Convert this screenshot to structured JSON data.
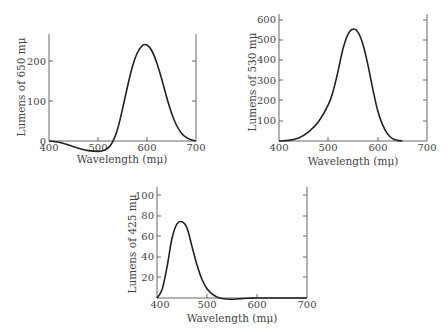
{
  "chart_data": [
    {
      "type": "line",
      "title": "",
      "xlabel": "Wavelength (mμ)",
      "ylabel": "Lumens of 650 mμ",
      "xlim": [
        400,
        700
      ],
      "ylim": [
        -30,
        260
      ],
      "xticks": [
        400,
        500,
        600,
        700
      ],
      "yticks": [
        0,
        100,
        200
      ],
      "grid": false,
      "x": [
        400,
        420,
        440,
        460,
        480,
        500,
        510,
        520,
        530,
        540,
        550,
        560,
        570,
        580,
        590,
        600,
        610,
        620,
        630,
        640,
        650,
        660,
        670,
        680,
        690,
        700
      ],
      "values": [
        0,
        -3,
        -10,
        -18,
        -24,
        -26,
        -24,
        -18,
        -2,
        30,
        80,
        135,
        185,
        220,
        238,
        240,
        225,
        195,
        155,
        110,
        70,
        40,
        20,
        9,
        3,
        0
      ],
      "plot_box": {
        "x0": 49,
        "x1": 196,
        "y_zero": 141,
        "px_per_unit_y": 0.4
      }
    },
    {
      "type": "line",
      "title": "",
      "xlabel": "Wavelength (mμ)",
      "ylabel": "Lumens of 530 mμ",
      "xlim": [
        400,
        700
      ],
      "ylim": [
        0,
        640
      ],
      "xticks": [
        400,
        500,
        600,
        700
      ],
      "yticks": [
        100,
        200,
        300,
        400,
        500,
        600
      ],
      "grid": false,
      "x": [
        400,
        420,
        440,
        460,
        480,
        500,
        510,
        520,
        530,
        540,
        550,
        560,
        570,
        580,
        590,
        600,
        610,
        620,
        630,
        640,
        650
      ],
      "values": [
        0,
        3,
        15,
        45,
        95,
        180,
        250,
        350,
        460,
        530,
        555,
        540,
        480,
        380,
        260,
        150,
        80,
        35,
        12,
        3,
        0
      ],
      "plot_box": {
        "x0": 279,
        "x1": 427,
        "y_zero": 141,
        "px_per_unit_y": 0.2017
      }
    },
    {
      "type": "line",
      "title": "",
      "xlabel": "Wavelength (mμ)",
      "ylabel": "Lumens of 425 mμ",
      "xlim": [
        400,
        700
      ],
      "ylim": [
        -3,
        108
      ],
      "xticks": [
        400,
        500,
        600,
        700
      ],
      "yticks": [
        20,
        40,
        60,
        80,
        100
      ],
      "grid": false,
      "x": [
        400,
        410,
        420,
        430,
        440,
        450,
        460,
        470,
        480,
        490,
        500,
        510,
        520,
        530,
        540,
        550,
        560,
        570,
        580,
        600,
        620,
        650,
        700
      ],
      "values": [
        0,
        8,
        30,
        58,
        72,
        74,
        68,
        50,
        32,
        18,
        9,
        4,
        1,
        -0.5,
        -1,
        -1.2,
        -1,
        -0.6,
        -0.3,
        0,
        0,
        0,
        0
      ],
      "plot_box": {
        "x0": 157,
        "x1": 307,
        "y_zero": 298,
        "px_per_unit_y": 1.03
      }
    }
  ]
}
